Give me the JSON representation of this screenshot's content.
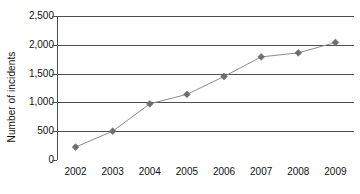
{
  "chart_data": {
    "type": "line",
    "title": "",
    "xlabel": "",
    "ylabel": "Number of incidents",
    "categories": [
      "2002",
      "2003",
      "2004",
      "2005",
      "2006",
      "2007",
      "2008",
      "2009"
    ],
    "values": [
      225,
      500,
      975,
      1140,
      1450,
      1790,
      1860,
      2040
    ],
    "series": [
      {
        "name": "Number of incidents",
        "values": [
          225,
          500,
          975,
          1140,
          1450,
          1790,
          1860,
          2040
        ]
      }
    ],
    "ylim": [
      0,
      2500
    ],
    "y_ticks": [
      0,
      500,
      1000,
      1500,
      2000,
      2500
    ],
    "y_tick_labels": [
      "0",
      "500",
      "1,000",
      "1,500",
      "2,000",
      "2,500"
    ],
    "x_tick_labels": [
      "2002",
      "2003",
      "2004",
      "2005",
      "2006",
      "2007",
      "2008",
      "2009"
    ],
    "grid": "horizontal",
    "legend": "none",
    "marker": "diamond",
    "colors": {
      "line": "#8c8c8c",
      "marker": "#6e6e6e",
      "grid": "#4d4d4d",
      "axis": "#4d4d4d",
      "text": "#111111",
      "background": "#ffffff"
    }
  }
}
